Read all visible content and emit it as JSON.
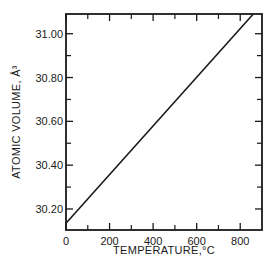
{
  "chart_data": {
    "type": "line",
    "title": "",
    "xlabel": "TEMPERATURE,°C",
    "ylabel": "ATOMIC VOLUME, Å³",
    "xlim": [
      0,
      900
    ],
    "ylim": [
      30.104,
      31.09
    ],
    "x_ticks": [
      0,
      200,
      400,
      600,
      800
    ],
    "x_tick_labels": [
      "0",
      "200",
      "400",
      "600",
      "800"
    ],
    "x_minor_ticks": [
      100,
      300,
      500,
      700
    ],
    "y_ticks": [
      30.2,
      30.4,
      30.6,
      30.8,
      31.0
    ],
    "y_tick_labels": [
      "30.20",
      "30.40",
      "30.60",
      "30.80",
      "31.00"
    ],
    "y_minor_ticks": [
      30.3,
      30.5,
      30.7,
      30.9
    ],
    "grid": false,
    "legend": null,
    "series": [
      {
        "name": "Atomic volume",
        "x": [
          0,
          860
        ],
        "y": [
          30.135,
          31.09
        ]
      }
    ]
  }
}
